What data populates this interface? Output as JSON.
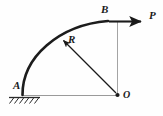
{
  "figure": {
    "kind": "engineering-mechanics-free-body-diagram",
    "background_color": "#fefefe",
    "ink_color": "#1a1a1a",
    "thin_line_color": "#8c8c8c",
    "labels": {
      "support_point": "A",
      "load_point": "B",
      "force": "P",
      "radius": "R",
      "center": "O"
    },
    "elements": {
      "arc_label": "quarter-circle-curved-bar",
      "support_label": "fixed-hatched-ground-support",
      "force_arrow_label": "horizontal-force-arrow",
      "radius_arrow_label": "radius-arrow",
      "vertical_leader_label": "vertical-construction-line",
      "horizontal_leader_label": "horizontal-construction-line",
      "center_dot_label": "center-point-dot"
    },
    "geometry": {
      "center_x": 118,
      "center_y": 95,
      "radius": 74,
      "arc_start_x": 22,
      "arc_start_y": 95,
      "arc_end_x": 108,
      "arc_end_y": 21,
      "force_arrow_x1": 109,
      "force_arrow_x2": 145,
      "force_arrow_y": 21,
      "radius_arrow_tip_x": 61,
      "radius_arrow_tip_y": 38,
      "hatch_count": 6
    }
  }
}
